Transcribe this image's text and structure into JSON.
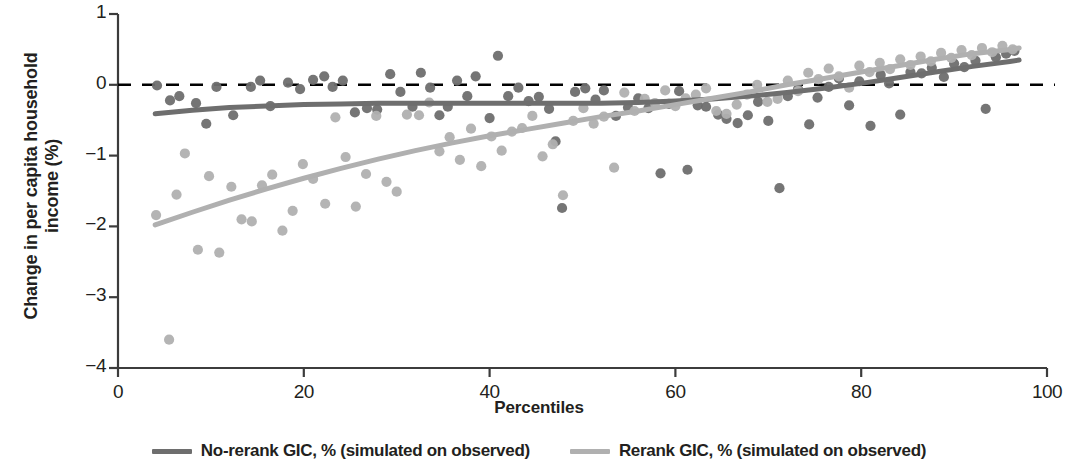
{
  "chart_data": {
    "type": "scatter",
    "title": "",
    "xlabel": "Percentiles",
    "ylabel": "Change in per capita household\nincome (%)",
    "xlim": [
      0,
      100
    ],
    "ylim": [
      -4,
      1
    ],
    "xticks": [
      0,
      20,
      40,
      60,
      80,
      100
    ],
    "yticks": [
      1,
      0,
      -1,
      -2,
      -3,
      -4
    ],
    "ytick_labels": [
      "1",
      "0",
      "−1",
      "−2",
      "−3",
      "−4"
    ],
    "grid": false,
    "legend_position": "bottom",
    "zero_reference_line": {
      "y": 0,
      "style": "dashed",
      "color": "#000000"
    },
    "colors": {
      "no_rerank": "#6e6e6e",
      "rerank": "#b0b0b0",
      "axis": "#3c3c3c",
      "text": "#231f20"
    },
    "series": [
      {
        "name": "No-rerank GIC, % (simulated on observed)",
        "type": "line",
        "color": "#6e6e6e",
        "x": [
          4,
          8,
          12,
          16,
          20,
          24,
          28,
          32,
          36,
          40,
          44,
          48,
          52,
          56,
          60,
          64,
          68,
          72,
          76,
          80,
          84,
          88,
          92,
          96,
          97
        ],
        "y": [
          -0.41,
          -0.36,
          -0.32,
          -0.3,
          -0.28,
          -0.27,
          -0.26,
          -0.26,
          -0.26,
          -0.26,
          -0.26,
          -0.26,
          -0.26,
          -0.25,
          -0.23,
          -0.2,
          -0.16,
          -0.11,
          -0.05,
          0.02,
          0.1,
          0.18,
          0.26,
          0.33,
          0.35
        ]
      },
      {
        "name": "Rerank GIC, % (simulated on observed)",
        "type": "line",
        "color": "#b0b0b0",
        "x": [
          4,
          8,
          12,
          16,
          20,
          24,
          28,
          32,
          36,
          40,
          44,
          48,
          52,
          56,
          60,
          64,
          68,
          72,
          76,
          80,
          84,
          88,
          92,
          96,
          97
        ],
        "y": [
          -1.98,
          -1.8,
          -1.63,
          -1.47,
          -1.32,
          -1.18,
          -1.05,
          -0.93,
          -0.82,
          -0.72,
          -0.63,
          -0.54,
          -0.45,
          -0.37,
          -0.28,
          -0.19,
          -0.1,
          0.0,
          0.09,
          0.18,
          0.27,
          0.36,
          0.44,
          0.5,
          0.52
        ]
      },
      {
        "name": "No-rerank GIC points",
        "type": "scatter",
        "color": "#6e6e6e",
        "points": [
          [
            4.2,
            -0.01
          ],
          [
            5.6,
            -0.22
          ],
          [
            6.6,
            -0.16
          ],
          [
            8.4,
            -0.26
          ],
          [
            9.5,
            -0.55
          ],
          [
            10.6,
            -0.03
          ],
          [
            12.4,
            -0.43
          ],
          [
            14.3,
            -0.03
          ],
          [
            15.3,
            0.06
          ],
          [
            16.4,
            -0.3
          ],
          [
            18.3,
            0.03
          ],
          [
            19.6,
            -0.06
          ],
          [
            21.0,
            0.07
          ],
          [
            22.2,
            0.12
          ],
          [
            23.1,
            -0.03
          ],
          [
            24.2,
            0.06
          ],
          [
            25.5,
            -0.39
          ],
          [
            26.8,
            -0.33
          ],
          [
            27.9,
            -0.35
          ],
          [
            29.3,
            0.15
          ],
          [
            30.4,
            -0.1
          ],
          [
            31.7,
            -0.31
          ],
          [
            32.6,
            0.17
          ],
          [
            33.6,
            -0.04
          ],
          [
            34.6,
            -0.43
          ],
          [
            35.5,
            -0.31
          ],
          [
            36.5,
            0.06
          ],
          [
            37.6,
            -0.16
          ],
          [
            38.5,
            0.12
          ],
          [
            40.0,
            -0.47
          ],
          [
            40.9,
            0.41
          ],
          [
            42.0,
            -0.16
          ],
          [
            43.1,
            -0.04
          ],
          [
            44.2,
            -0.23
          ],
          [
            45.3,
            -0.17
          ],
          [
            46.4,
            -0.34
          ],
          [
            47.1,
            -0.8
          ],
          [
            47.8,
            -1.74
          ],
          [
            49.2,
            -0.1
          ],
          [
            50.3,
            -0.05
          ],
          [
            51.4,
            -0.21
          ],
          [
            52.3,
            -0.08
          ],
          [
            53.6,
            -0.44
          ],
          [
            54.9,
            -0.32
          ],
          [
            56.0,
            -0.19
          ],
          [
            57.1,
            -0.33
          ],
          [
            58.4,
            -1.25
          ],
          [
            59.3,
            -0.27
          ],
          [
            60.4,
            -0.09
          ],
          [
            61.3,
            -1.2
          ],
          [
            62.4,
            -0.29
          ],
          [
            63.3,
            -0.31
          ],
          [
            64.6,
            -0.42
          ],
          [
            65.5,
            -0.48
          ],
          [
            66.7,
            -0.54
          ],
          [
            67.8,
            -0.43
          ],
          [
            68.9,
            -0.24
          ],
          [
            70.0,
            -0.51
          ],
          [
            71.2,
            -1.46
          ],
          [
            72.1,
            -0.16
          ],
          [
            73.2,
            -0.06
          ],
          [
            74.4,
            -0.56
          ],
          [
            75.3,
            -0.18
          ],
          [
            76.5,
            -0.03
          ],
          [
            77.6,
            0.09
          ],
          [
            78.7,
            -0.29
          ],
          [
            79.8,
            0.05
          ],
          [
            81.0,
            -0.58
          ],
          [
            82.1,
            0.14
          ],
          [
            83.0,
            0.02
          ],
          [
            84.2,
            -0.42
          ],
          [
            85.3,
            0.18
          ],
          [
            86.5,
            0.16
          ],
          [
            87.6,
            0.24
          ],
          [
            88.9,
            0.11
          ],
          [
            90.0,
            0.3
          ],
          [
            91.1,
            0.25
          ],
          [
            92.3,
            0.34
          ],
          [
            93.4,
            -0.34
          ],
          [
            94.5,
            0.39
          ],
          [
            95.6,
            0.44
          ],
          [
            96.5,
            0.48
          ]
        ]
      },
      {
        "name": "Rerank GIC points",
        "type": "scatter",
        "color": "#b0b0b0",
        "points": [
          [
            4.1,
            -1.84
          ],
          [
            5.5,
            -3.6
          ],
          [
            6.3,
            -1.55
          ],
          [
            7.2,
            -0.97
          ],
          [
            8.6,
            -2.33
          ],
          [
            9.8,
            -1.29
          ],
          [
            10.9,
            -2.37
          ],
          [
            12.2,
            -1.44
          ],
          [
            13.3,
            -1.9
          ],
          [
            14.4,
            -1.93
          ],
          [
            15.5,
            -1.42
          ],
          [
            16.6,
            -1.27
          ],
          [
            17.7,
            -2.06
          ],
          [
            18.8,
            -1.78
          ],
          [
            19.9,
            -1.12
          ],
          [
            21.0,
            -1.33
          ],
          [
            22.3,
            -1.68
          ],
          [
            23.4,
            -0.46
          ],
          [
            24.5,
            -1.02
          ],
          [
            25.6,
            -1.72
          ],
          [
            26.7,
            -1.26
          ],
          [
            27.8,
            -0.44
          ],
          [
            28.9,
            -1.37
          ],
          [
            30.0,
            -1.51
          ],
          [
            31.1,
            -0.42
          ],
          [
            32.4,
            -0.43
          ],
          [
            33.5,
            -0.25
          ],
          [
            34.6,
            -0.94
          ],
          [
            35.7,
            -0.74
          ],
          [
            36.8,
            -1.06
          ],
          [
            38.0,
            -0.62
          ],
          [
            39.1,
            -1.15
          ],
          [
            40.2,
            -0.73
          ],
          [
            41.3,
            -0.93
          ],
          [
            42.4,
            -0.66
          ],
          [
            43.5,
            -0.61
          ],
          [
            44.6,
            -0.44
          ],
          [
            45.7,
            -1.01
          ],
          [
            46.8,
            -0.84
          ],
          [
            47.9,
            -1.56
          ],
          [
            49.0,
            -0.51
          ],
          [
            50.1,
            -0.33
          ],
          [
            51.2,
            -0.55
          ],
          [
            52.3,
            -0.45
          ],
          [
            53.4,
            -1.17
          ],
          [
            54.5,
            -0.11
          ],
          [
            55.6,
            -0.37
          ],
          [
            56.7,
            -0.2
          ],
          [
            57.8,
            -0.26
          ],
          [
            58.9,
            -0.08
          ],
          [
            60.0,
            -0.3
          ],
          [
            61.1,
            -0.19
          ],
          [
            62.2,
            -0.14
          ],
          [
            63.3,
            -0.05
          ],
          [
            64.4,
            -0.37
          ],
          [
            65.5,
            -0.41
          ],
          [
            66.6,
            -0.28
          ],
          [
            67.7,
            -0.14
          ],
          [
            68.8,
            0.0
          ],
          [
            69.9,
            -0.24
          ],
          [
            71.0,
            -0.2
          ],
          [
            72.1,
            0.06
          ],
          [
            73.2,
            -0.09
          ],
          [
            74.3,
            0.17
          ],
          [
            75.4,
            0.08
          ],
          [
            76.5,
            0.23
          ],
          [
            77.6,
            0.12
          ],
          [
            78.7,
            -0.04
          ],
          [
            79.8,
            0.27
          ],
          [
            80.9,
            0.18
          ],
          [
            82.0,
            0.31
          ],
          [
            83.1,
            0.22
          ],
          [
            84.2,
            0.36
          ],
          [
            85.3,
            0.28
          ],
          [
            86.4,
            0.4
          ],
          [
            87.5,
            0.33
          ],
          [
            88.6,
            0.45
          ],
          [
            89.7,
            0.38
          ],
          [
            90.8,
            0.49
          ],
          [
            91.9,
            0.42
          ],
          [
            93.0,
            0.52
          ],
          [
            94.1,
            0.46
          ],
          [
            95.2,
            0.55
          ],
          [
            96.3,
            0.5
          ]
        ]
      }
    ]
  },
  "legend": {
    "entries": [
      {
        "label": "No-rerank GIC, % (simulated on observed)",
        "color": "#6e6e6e"
      },
      {
        "label": "Rerank GIC, % (simulated on observed)",
        "color": "#b0b0b0"
      }
    ]
  },
  "axes": {
    "x_title": "Percentiles",
    "y_title": "Change in per capita household\nincome (%)",
    "x_tick_labels": [
      "0",
      "20",
      "40",
      "60",
      "80",
      "100"
    ],
    "y_tick_labels": [
      "1",
      "0",
      "−1",
      "−2",
      "−3",
      "−4"
    ]
  }
}
